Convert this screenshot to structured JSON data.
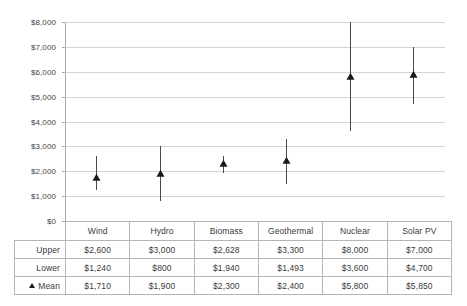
{
  "chart_data": {
    "type": "scatter",
    "title": "",
    "xlabel": "",
    "ylabel": "",
    "ylim": [
      0,
      8000
    ],
    "ytick_step": 1000,
    "grid": true,
    "legend": false,
    "currency_prefix": "$",
    "categories": [
      "Wind",
      "Hydro",
      "Biomass",
      "Geothermal",
      "Nuclear",
      "Solar PV"
    ],
    "ytick_labels": [
      "$8,000",
      "$7,000",
      "$6,000",
      "$5,000",
      "$4,000",
      "$3,000",
      "$2,000",
      "$1,000",
      "$0"
    ],
    "ytick_values": [
      8000,
      7000,
      6000,
      5000,
      4000,
      3000,
      2000,
      1000,
      0
    ],
    "series": [
      {
        "name": "Upper",
        "values": [
          2600,
          3000,
          2628,
          3300,
          8000,
          7000
        ]
      },
      {
        "name": "Lower",
        "values": [
          1240,
          800,
          1940,
          1493,
          3600,
          4700
        ]
      },
      {
        "name": "Mean",
        "values": [
          1710,
          1900,
          2300,
          2400,
          5800,
          5850
        ]
      }
    ]
  },
  "table": {
    "row_labels": [
      "Upper",
      "Lower",
      "Mean"
    ],
    "mean_marker_label": "Mean",
    "header": [
      "",
      "Wind",
      "Hydro",
      "Biomass",
      "Geothermal",
      "Nuclear",
      "Solar PV"
    ],
    "rows": [
      {
        "label": "Upper",
        "cells": [
          "$2,600",
          "$3,000",
          "$2,628",
          "$3,300",
          "$8,000",
          "$7,000"
        ]
      },
      {
        "label": "Lower",
        "cells": [
          "$1,240",
          "$800",
          "$1,940",
          "$1,493",
          "$3,600",
          "$4,700"
        ]
      },
      {
        "label": "Mean",
        "cells": [
          "$1,710",
          "$1,900",
          "$2,300",
          "$2,400",
          "$5,800",
          "$5,850"
        ]
      }
    ]
  },
  "colors": {
    "gridline": "#d4d4d4",
    "axis": "#a6a6a6",
    "marker": "#1a1a1a",
    "whisker": "#4a4a4a",
    "text": "#3b3b3b",
    "table_border": "#b5b5b5"
  }
}
